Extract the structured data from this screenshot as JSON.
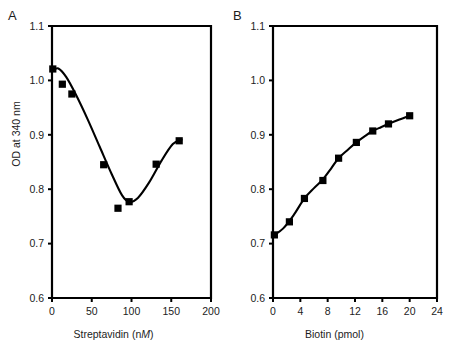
{
  "figure": {
    "background": "#ffffff",
    "ink_color": "#000000"
  },
  "panels": [
    {
      "letter": "A",
      "chart_data": {
        "type": "scatter",
        "title": "",
        "xlabel_prefix": "Streptavidin (n",
        "xlabel_italic": "M",
        "xlabel_suffix": ")",
        "xlabel": "Streptavidin (nM)",
        "ylabel": "OD at 340 nm",
        "xlim": [
          0,
          200
        ],
        "ylim": [
          0.6,
          1.1
        ],
        "xticks": [
          0,
          50,
          100,
          150,
          200
        ],
        "xtick_labels": [
          "0",
          "50",
          "100",
          "150",
          "200"
        ],
        "yticks": [
          0.6,
          0.7,
          0.8,
          0.9,
          1.0,
          1.1
        ],
        "ytick_labels": [
          "0.6",
          "0.7",
          "0.8",
          "0.9",
          "1.0",
          "1.1"
        ],
        "grid": false,
        "legend": false,
        "marker": "filled-square",
        "series": [
          {
            "name": "OD at 340 nm vs Streptavidin",
            "x": [
              1,
              13,
              25,
              65,
              83,
              97,
              131,
              160
            ],
            "values": [
              1.021,
              0.993,
              0.975,
              0.845,
              0.765,
              0.777,
              0.846,
              0.889
            ]
          }
        ],
        "fit_curve": {
          "description": "smooth U-shaped interpolation through points",
          "x": [
            0,
            8,
            18,
            30,
            45,
            60,
            75,
            88,
            97,
            108,
            122,
            138,
            152,
            163
          ],
          "y": [
            1.018,
            1.022,
            1.006,
            0.974,
            0.928,
            0.878,
            0.828,
            0.789,
            0.777,
            0.784,
            0.812,
            0.853,
            0.883,
            0.891
          ]
        }
      }
    },
    {
      "letter": "B",
      "chart_data": {
        "type": "scatter",
        "title": "",
        "xlabel_prefix": "Biotin (pmol",
        "xlabel_italic": "",
        "xlabel_suffix": ")",
        "xlabel": "Biotin (pmol)",
        "ylabel": "OD at 340 nm",
        "xlim": [
          0,
          24
        ],
        "ylim": [
          0.6,
          1.1
        ],
        "xticks": [
          0,
          4,
          8,
          12,
          16,
          20,
          24
        ],
        "xtick_labels": [
          "0",
          "4",
          "8",
          "12",
          "16",
          "20",
          "24"
        ],
        "yticks": [
          0.6,
          0.7,
          0.8,
          0.9,
          1.0,
          1.1
        ],
        "ytick_labels": [
          "0.6",
          "0.7",
          "0.8",
          "0.9",
          "1.0",
          "1.1"
        ],
        "grid": false,
        "legend": false,
        "marker": "filled-square",
        "series": [
          {
            "name": "OD at 340 nm vs Biotin",
            "x": [
              0.2,
              2.4,
              4.6,
              7.3,
              9.6,
              12.2,
              14.6,
              16.9,
              20.0
            ],
            "values": [
              0.716,
              0.74,
              0.783,
              0.816,
              0.857,
              0.886,
              0.907,
              0.92,
              0.935
            ]
          }
        ],
        "fit_curve": {
          "description": "smooth saturating interpolation through points",
          "x": [
            0.2,
            1.5,
            3.0,
            4.6,
            6.0,
            7.3,
            8.5,
            9.6,
            11.0,
            12.2,
            13.5,
            14.6,
            15.8,
            16.9,
            18.5,
            20.0
          ],
          "y": [
            0.716,
            0.728,
            0.752,
            0.783,
            0.802,
            0.818,
            0.838,
            0.857,
            0.873,
            0.886,
            0.898,
            0.907,
            0.914,
            0.92,
            0.928,
            0.935
          ]
        }
      }
    }
  ]
}
